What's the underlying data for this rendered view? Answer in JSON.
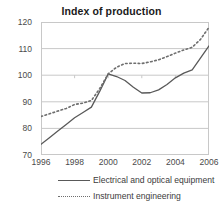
{
  "chart_data": {
    "type": "line",
    "title": "Index of production",
    "xlabel": "",
    "ylabel": "",
    "grid": true,
    "legend_position": "bottom",
    "xlim": [
      1996,
      2006
    ],
    "ylim": [
      70,
      120
    ],
    "yticks": [
      70,
      80,
      90,
      100,
      110,
      120
    ],
    "ytick_labels": [
      "70",
      "80",
      "90",
      "100",
      "110",
      "120"
    ],
    "xticks": [
      1996,
      1998,
      2000,
      2002,
      2004,
      2006
    ],
    "xtick_labels": [
      "1996",
      "1998",
      "2000",
      "2002",
      "2004",
      "2006"
    ],
    "x": [
      1996,
      1996.5,
      1997,
      1997.5,
      1998,
      1998.5,
      1999,
      1999.5,
      2000,
      2000.5,
      2001,
      2001.5,
      2002,
      2002.5,
      2003,
      2003.5,
      2004,
      2004.5,
      2005,
      2005.5,
      2006
    ],
    "series": [
      {
        "name": "Electrical and optical equipment",
        "style": "solid",
        "color": "#595959",
        "values": [
          74.0,
          76.5,
          79.0,
          81.5,
          84.0,
          86.0,
          88.0,
          94.0,
          100.5,
          99.5,
          98.0,
          95.5,
          93.3,
          93.4,
          94.5,
          96.5,
          99.0,
          100.8,
          102.0,
          106.5,
          111.0
        ]
      },
      {
        "name": "Instrument engineering",
        "style": "dotted",
        "color": "#6e6e6e",
        "values": [
          84.5,
          85.5,
          86.5,
          87.5,
          89.0,
          89.5,
          90.5,
          95.0,
          100.5,
          103.0,
          104.4,
          104.5,
          104.4,
          105.0,
          105.8,
          107.0,
          108.3,
          109.5,
          110.5,
          113.5,
          118.0
        ]
      }
    ]
  },
  "legend": {
    "items": [
      {
        "label": "Electrical and optical equipment",
        "style": "solid"
      },
      {
        "label": "Instrument engineering",
        "style": "dotted"
      }
    ]
  },
  "colors": {
    "series_solid": "#595959",
    "series_dotted": "#6e6e6e",
    "gridline": "#c8c8c8",
    "frame": "#c8c8c8",
    "text": "#3b3b3b",
    "title": "#1a1a1a",
    "background": "#ffffff"
  }
}
